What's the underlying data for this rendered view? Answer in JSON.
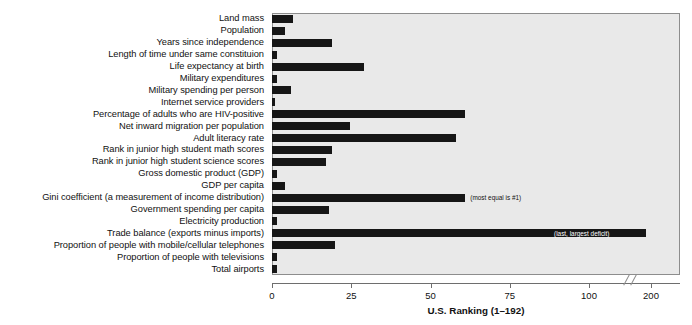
{
  "chart_data": {
    "type": "bar",
    "orientation": "horizontal",
    "title": "",
    "xlabel": "U.S. Ranking (1–192)",
    "ylabel": "",
    "xlim": [
      0,
      200
    ],
    "xticks": [
      0,
      25,
      50,
      75,
      100,
      200
    ],
    "xtick_labels": [
      "0",
      "25",
      "50",
      "75",
      "100",
      "200"
    ],
    "axis_break": {
      "present": true,
      "between": [
        100,
        200
      ],
      "symbol": "//"
    },
    "grid": false,
    "legend": null,
    "bar_color": "#161616",
    "plot_background": "#e9e9e9",
    "categories": [
      "Land mass",
      "Population",
      "Years since independence",
      "Length of time under same constituion",
      "Life expectancy at birth",
      "Military expenditures",
      "Military spending per person",
      "Internet service providers",
      "Percentage of adults who are HIV-positive",
      "Net inward migration per population",
      "Adult literacy rate",
      "Rank in junior high student math scores",
      "Rank in junior high student science scores",
      "Gross domestic product (GDP)",
      "GDP per capita",
      "Gini coefficient (a measurement of income distribution)",
      "Government spending per capita",
      "Electricity production",
      "Trade balance (exports minus imports)",
      "Proportion of people with mobile/cellular telephones",
      "Proportion of people with televisions",
      "Total airports"
    ],
    "values": [
      6.5,
      4,
      19,
      1.5,
      29,
      1.5,
      6,
      1,
      61,
      24.5,
      58,
      19,
      17,
      1.5,
      4,
      61,
      18,
      1.5,
      192,
      20,
      1.5,
      1.5
    ],
    "annotations": [
      {
        "category": "Gini coefficient (a measurement of income distribution)",
        "text": "(most equal is #1)",
        "placement": "outside-right"
      },
      {
        "category": "Trade balance (exports minus imports)",
        "text": "(last, largest deficit)",
        "placement": "inside-right"
      }
    ]
  }
}
